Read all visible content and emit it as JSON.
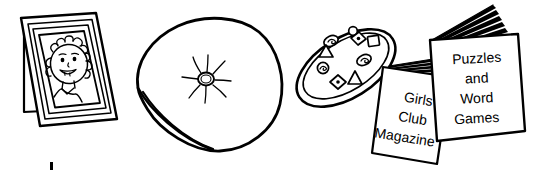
{
  "illustration": {
    "title": "Household objects line drawing",
    "style": "black-and-white line art",
    "background_color": "#ffffff",
    "ink_color": "#000000",
    "objects": [
      {
        "name": "photo-frame",
        "label": "Standing photo frame with child portrait",
        "contents": "smiling child face with curly hair"
      },
      {
        "name": "cushion",
        "label": "Square cushion with centre button",
        "contents": "button with radiating stitching"
      },
      {
        "name": "cookie-tray",
        "label": "Oval tray of shaped biscuits",
        "shapes": [
          "circle",
          "oval",
          "triangle",
          "diamond",
          "square",
          "diamond",
          "oval",
          "triangle",
          "diamond",
          "circle"
        ]
      },
      {
        "name": "magazine-left",
        "label": "Girls' Club Magazine"
      },
      {
        "name": "book-right",
        "label": "Puzzles and Word Games"
      }
    ]
  },
  "magazine_left": {
    "line1": "Girls'",
    "line2": "Club",
    "line3": "Magazine"
  },
  "book_right": {
    "line1": "Puzzles",
    "line2": "and",
    "line3": "Word",
    "line4": "Games"
  },
  "page_mark": {
    "symbol": ""
  }
}
